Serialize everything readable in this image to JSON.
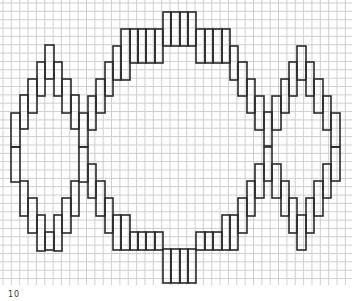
{
  "figure": {
    "grid": {
      "pitch_px": 8.35,
      "origin_x": 3,
      "origin_y": 3,
      "color": "#c9c9c9"
    },
    "stroke_color": "#2a2a2a",
    "label": "10"
  },
  "shapes": [
    {
      "name": "left-diamond",
      "rects": [
        [
          11,
          113,
          9,
          34
        ],
        [
          11,
          147,
          9,
          35
        ],
        [
          20,
          95,
          8,
          34
        ],
        [
          20,
          181,
          8,
          35
        ],
        [
          28,
          79,
          9,
          34
        ],
        [
          28,
          198,
          9,
          35
        ],
        [
          37,
          62,
          8,
          34
        ],
        [
          37,
          215,
          8,
          36
        ],
        [
          45,
          45,
          9,
          34
        ],
        [
          45,
          232,
          9,
          18
        ],
        [
          54,
          62,
          8,
          34
        ],
        [
          54,
          215,
          8,
          36
        ],
        [
          62,
          79,
          9,
          34
        ],
        [
          62,
          198,
          9,
          35
        ],
        [
          71,
          95,
          8,
          34
        ],
        [
          71,
          181,
          8,
          35
        ],
        [
          79,
          113,
          9,
          34
        ],
        [
          79,
          147,
          9,
          35
        ]
      ]
    },
    {
      "name": "center-lozenge",
      "rects": [
        [
          88,
          96,
          8,
          34
        ],
        [
          88,
          164,
          8,
          34
        ],
        [
          96,
          79,
          9,
          34
        ],
        [
          96,
          181,
          9,
          35
        ],
        [
          105,
          62,
          8,
          34
        ],
        [
          105,
          198,
          8,
          35
        ],
        [
          113,
          46,
          8,
          34
        ],
        [
          113,
          215,
          8,
          35
        ],
        [
          121,
          29,
          9,
          51
        ],
        [
          121,
          215,
          9,
          35
        ],
        [
          130,
          29,
          8,
          34
        ],
        [
          130,
          232,
          8,
          18
        ],
        [
          138,
          29,
          8,
          34
        ],
        [
          138,
          232,
          8,
          18
        ],
        [
          146,
          29,
          9,
          34
        ],
        [
          146,
          232,
          9,
          18
        ],
        [
          155,
          29,
          8,
          34
        ],
        [
          155,
          232,
          8,
          18
        ],
        [
          163,
          12,
          8,
          34
        ],
        [
          163,
          249,
          8,
          34
        ],
        [
          171,
          12,
          9,
          34
        ],
        [
          171,
          249,
          9,
          34
        ],
        [
          180,
          12,
          8,
          34
        ],
        [
          180,
          249,
          8,
          34
        ],
        [
          188,
          12,
          8,
          34
        ],
        [
          188,
          249,
          8,
          34
        ],
        [
          196,
          29,
          9,
          34
        ],
        [
          196,
          232,
          9,
          18
        ],
        [
          205,
          29,
          8,
          34
        ],
        [
          205,
          232,
          8,
          18
        ],
        [
          213,
          29,
          9,
          34
        ],
        [
          213,
          232,
          9,
          18
        ],
        [
          222,
          29,
          8,
          34
        ],
        [
          222,
          215,
          8,
          35
        ],
        [
          230,
          46,
          8,
          34
        ],
        [
          230,
          215,
          8,
          35
        ],
        [
          238,
          62,
          9,
          34
        ],
        [
          238,
          198,
          9,
          35
        ],
        [
          247,
          79,
          8,
          34
        ],
        [
          247,
          181,
          8,
          35
        ],
        [
          255,
          96,
          9,
          34
        ],
        [
          255,
          164,
          9,
          34
        ],
        [
          264,
          112,
          8,
          34
        ],
        [
          264,
          147,
          8,
          34
        ]
      ]
    },
    {
      "name": "right-diamond",
      "rects": [
        [
          272,
          96,
          9,
          34
        ],
        [
          272,
          164,
          9,
          34
        ],
        [
          281,
          79,
          8,
          34
        ],
        [
          281,
          181,
          8,
          35
        ],
        [
          289,
          62,
          8,
          34
        ],
        [
          289,
          198,
          8,
          35
        ],
        [
          297,
          46,
          9,
          34
        ],
        [
          297,
          215,
          9,
          35
        ],
        [
          306,
          62,
          8,
          34
        ],
        [
          306,
          198,
          8,
          35
        ],
        [
          314,
          79,
          9,
          34
        ],
        [
          314,
          181,
          9,
          35
        ],
        [
          323,
          96,
          8,
          34
        ],
        [
          323,
          164,
          8,
          34
        ],
        [
          331,
          113,
          9,
          34
        ],
        [
          331,
          147,
          9,
          34
        ]
      ]
    }
  ]
}
